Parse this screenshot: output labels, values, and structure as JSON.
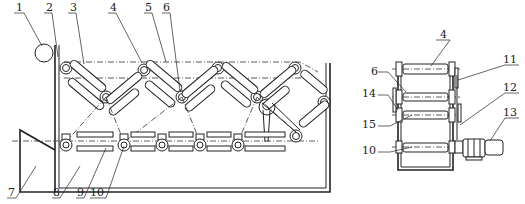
{
  "figure": {
    "type": "mechanical-drawing",
    "views": [
      "front-view",
      "side-view"
    ],
    "labels": {
      "l1": "1",
      "l2": "2",
      "l3": "3",
      "l4": "4",
      "l5": "5",
      "l6": "6",
      "l7": "7",
      "l8": "8",
      "l9": "9",
      "l10": "10",
      "r4": "4",
      "r6": "6",
      "r11": "11",
      "r14": "14",
      "r12": "12",
      "r13": "13",
      "r15": "15",
      "r10": "10"
    }
  }
}
